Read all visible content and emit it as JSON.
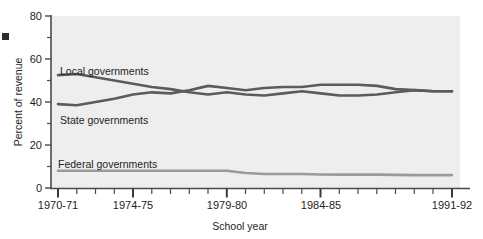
{
  "chart_data": {
    "type": "line",
    "title": "",
    "subtitle": "",
    "xlabel": "School year",
    "ylabel": "Percent of revenue",
    "ylim": [
      0,
      80
    ],
    "yticks": [
      0,
      20,
      40,
      60,
      80
    ],
    "ytick_labels": [
      "0",
      "20",
      "40",
      "60",
      "80"
    ],
    "yminor_ticks": [
      10,
      30,
      50,
      70
    ],
    "grid": false,
    "legend_position": "inline-annotations",
    "x": [
      "1970-71",
      "1971-72",
      "1972-73",
      "1973-74",
      "1974-75",
      "1975-76",
      "1976-77",
      "1977-78",
      "1978-79",
      "1979-80",
      "1980-81",
      "1981-82",
      "1982-83",
      "1983-84",
      "1984-85",
      "1985-86",
      "1986-87",
      "1987-88",
      "1988-89",
      "1989-90",
      "1990-91",
      "1991-92"
    ],
    "xtick_labels": [
      "1970-71",
      "1974-75",
      "1979-80",
      "1984-85",
      "1991-92"
    ],
    "xtick_label_positions": [
      "1970-71",
      "1974-75",
      "1979-80",
      "1984-85",
      "1991-92"
    ],
    "series": [
      {
        "name": "Local governments",
        "color": "#5b5b5b",
        "values": [
          52.5,
          53.0,
          51.5,
          50.0,
          48.5,
          47.0,
          46.0,
          44.5,
          43.5,
          44.5,
          43.5,
          43.0,
          44.0,
          45.0,
          44.0,
          43.0,
          43.0,
          43.5,
          44.5,
          45.5,
          45.0,
          45.0
        ]
      },
      {
        "name": "State governments",
        "color": "#5b5b5b",
        "values": [
          39.0,
          38.5,
          40.0,
          41.5,
          43.5,
          44.5,
          44.0,
          45.5,
          47.5,
          46.5,
          45.5,
          46.5,
          47.0,
          47.0,
          48.0,
          48.0,
          48.0,
          47.5,
          46.0,
          45.5,
          45.0,
          45.0
        ]
      },
      {
        "name": "Federal governments",
        "color": "#9a9a9a",
        "values": [
          8.0,
          8.0,
          8.0,
          8.0,
          8.0,
          8.0,
          8.0,
          8.0,
          8.0,
          8.0,
          7.0,
          6.5,
          6.5,
          6.5,
          6.3,
          6.2,
          6.2,
          6.2,
          6.1,
          6.0,
          6.0,
          6.0
        ]
      }
    ],
    "annotations": [
      {
        "text": "Local governments",
        "x_px": 60,
        "y_px": 72
      },
      {
        "text": "State governments",
        "x_px": 60,
        "y_px": 122
      },
      {
        "text": "Federal governments",
        "x_px": 58,
        "y_px": 166
      }
    ]
  },
  "axis": {
    "y_title": "Percent of revenue",
    "x_title": "School year",
    "y_labels": [
      "80",
      "60",
      "40",
      "20",
      "0"
    ],
    "x_labels": [
      "1970-71",
      "1974-75",
      "1979-80",
      "1984-85",
      "1991-92"
    ]
  },
  "colors": {
    "plot_background": "#eeeeee",
    "axis_line": "#4a4a4a",
    "dark_series": "#5b5b5b",
    "light_series": "#9a9a9a",
    "text": "#1d1d1d"
  }
}
